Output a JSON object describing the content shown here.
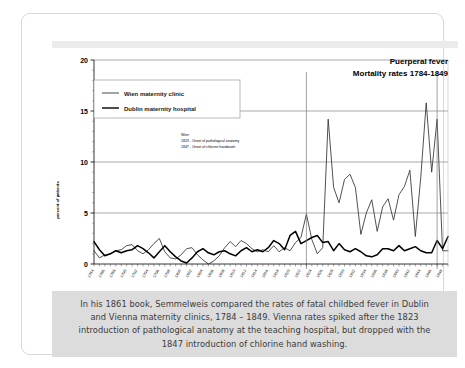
{
  "caption": {
    "text": "In his 1861 book, Semmelweis compared the rates of fatal childbed fever in Dublin and Vienna maternity clinics, 1784 – 1849. Vienna rates spiked after the 1823 introduction of pathological anatomy at the teaching hospital, but dropped with the 1847 introduction of chlorine hand washing."
  },
  "chart_data": {
    "type": "line",
    "title": "Puerperal fever",
    "subtitle": "Mortality rates 1784-1849",
    "xlabel": "",
    "ylabel": "percent of patients",
    "ylim": [
      0,
      20
    ],
    "yticks": [
      0,
      5,
      10,
      15,
      20
    ],
    "ytick_labels": [
      "0",
      "5",
      "10",
      "15",
      "20"
    ],
    "grid": "horizontal",
    "legend_position": "top-left",
    "x": [
      1784,
      1785,
      1786,
      1787,
      1788,
      1789,
      1790,
      1791,
      1792,
      1793,
      1794,
      1795,
      1796,
      1797,
      1798,
      1799,
      1800,
      1801,
      1802,
      1803,
      1804,
      1805,
      1806,
      1807,
      1808,
      1809,
      1810,
      1811,
      1812,
      1813,
      1814,
      1815,
      1816,
      1817,
      1818,
      1819,
      1820,
      1821,
      1822,
      1823,
      1824,
      1825,
      1826,
      1827,
      1828,
      1829,
      1830,
      1831,
      1832,
      1833,
      1834,
      1835,
      1836,
      1837,
      1838,
      1839,
      1840,
      1841,
      1842,
      1843,
      1844,
      1845,
      1846,
      1847,
      1848,
      1849
    ],
    "xtick_labels": [
      "1784",
      "1786",
      "1788",
      "1790",
      "1792",
      "1794",
      "1796",
      "1798",
      "1800",
      "1802",
      "1804",
      "1806",
      "1808",
      "1810",
      "1812",
      "1814",
      "1816",
      "1818",
      "1820",
      "1822",
      "1824",
      "1826",
      "1828",
      "1830",
      "1832",
      "1834",
      "1836",
      "1838",
      "1840",
      "1842",
      "1844",
      "1846",
      "1848"
    ],
    "xtick_step": 2,
    "series": [
      {
        "name": "Wien maternity clinic",
        "color": "#333333",
        "values": [
          1.3,
          0.6,
          0.9,
          1.0,
          1.3,
          1.4,
          1.8,
          1.9,
          1.3,
          1.0,
          1.4,
          2.0,
          2.5,
          1.2,
          0.6,
          0.5,
          0.9,
          1.5,
          1.6,
          0.9,
          0.4,
          0.0,
          0.3,
          0.8,
          1.6,
          2.2,
          1.7,
          2.3,
          2.0,
          1.5,
          1.2,
          1.4,
          1.2,
          1.8,
          1.2,
          1.6,
          1.3,
          2.1,
          2.6,
          4.9,
          2.4,
          1.0,
          1.6,
          14.2,
          7.5,
          6.0,
          8.3,
          8.8,
          7.5,
          2.9,
          5.0,
          6.3,
          3.2,
          5.6,
          6.4,
          4.3,
          6.8,
          7.6,
          9.2,
          2.7,
          8.5,
          15.8,
          9.0,
          14.2,
          1.3,
          1.3
        ]
      },
      {
        "name": "Dublin maternity hospital",
        "color": "#000000",
        "values": [
          2.2,
          1.4,
          0.8,
          1.0,
          1.3,
          1.1,
          1.3,
          1.4,
          1.8,
          1.5,
          1.1,
          0.6,
          1.2,
          1.8,
          1.2,
          0.7,
          0.3,
          0.1,
          0.6,
          1.2,
          1.5,
          1.1,
          0.9,
          1.2,
          1.3,
          1.0,
          0.8,
          1.3,
          1.6,
          1.2,
          1.4,
          1.2,
          1.6,
          2.3,
          2.0,
          1.4,
          2.8,
          3.2,
          2.0,
          2.3,
          2.6,
          2.8,
          2.1,
          2.2,
          1.3,
          2.0,
          1.4,
          1.2,
          1.5,
          1.2,
          0.8,
          0.7,
          0.9,
          1.5,
          1.5,
          1.3,
          1.8,
          1.3,
          1.5,
          1.7,
          1.3,
          1.1,
          1.1,
          2.3,
          1.5,
          2.7
        ]
      }
    ],
    "annotations": [
      {
        "name": "wien-events-note",
        "lines": [
          "Wien",
          "1823 - Onset of pathological anatomy",
          "1847 - Onset of chlorine handwash"
        ]
      }
    ],
    "event_lines": [
      {
        "name": "1823-pathological-anatomy",
        "year": 1823
      },
      {
        "name": "1847-chlorine-handwash",
        "year": 1847
      }
    ]
  }
}
